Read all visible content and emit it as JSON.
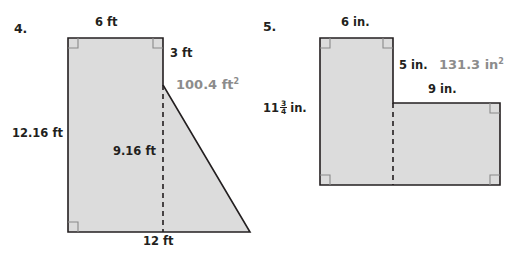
{
  "page": {
    "background_color": "#ffffff",
    "ink_color": "#231f20",
    "fill_color": "#dcdcdc",
    "accent_gray": "#8c8c8c"
  },
  "problems": [
    {
      "number": "4.",
      "shape": "right-trapezoid composite",
      "area_label": "100.4 ft",
      "area_exponent": "2",
      "labels": {
        "top": "6 ft",
        "right_upper": "3 ft",
        "left": "12.16 ft",
        "dashed_height": "9.16 ft",
        "bottom": "12 ft"
      }
    },
    {
      "number": "5.",
      "shape": "L-shape composite",
      "area_label": "131.3 in",
      "area_exponent": "2",
      "labels": {
        "top": "6 in.",
        "step_vertical": "5 in.",
        "step_top": "9 in.",
        "left_whole": "11",
        "left_num": "3",
        "left_den": "4",
        "left_unit": "in."
      }
    }
  ]
}
